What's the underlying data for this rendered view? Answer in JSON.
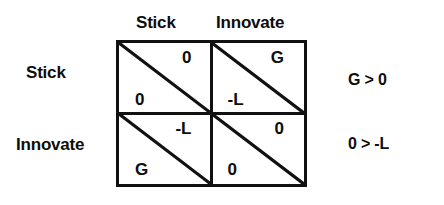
{
  "figure": {
    "type": "payoff-matrix",
    "ink_color": "#111111",
    "background_color": "#ffffff"
  },
  "matrix": {
    "column_headers": [
      "Stick",
      "Innovate"
    ],
    "row_labels": [
      "Stick",
      "Innovate"
    ],
    "cells": [
      [
        {
          "upper_right": "0",
          "lower_left": "0"
        },
        {
          "upper_right": "G",
          "lower_left": "-L"
        }
      ],
      [
        {
          "upper_right": "-L",
          "lower_left": "G"
        },
        {
          "upper_right": "0",
          "lower_left": "0"
        }
      ]
    ]
  },
  "conditions": [
    "G > 0",
    "0 > -L"
  ]
}
